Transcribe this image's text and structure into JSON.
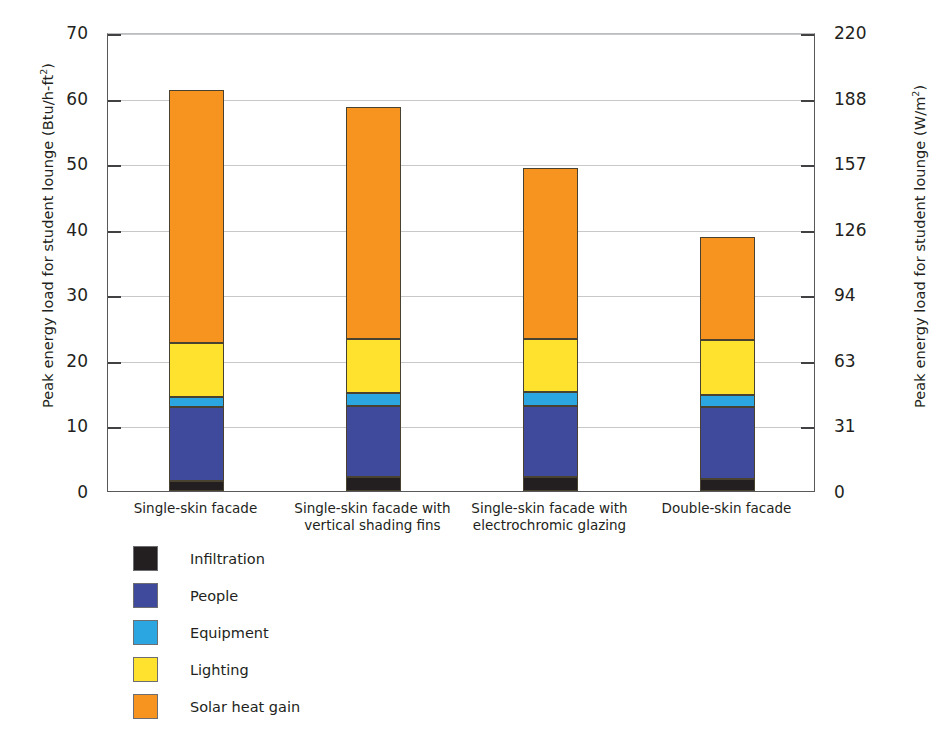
{
  "chart_data": {
    "type": "bar",
    "subtype": "stacked-bar",
    "title": "",
    "xlabel": "",
    "ylabel": "Peak energy load for student lounge (Btu/h-ft²)",
    "ylabel_right": "Peak energy load for student lounge (W/m²)",
    "grid": true,
    "legend_position": "below-left",
    "ylim": [
      0,
      70
    ],
    "ylim_right": [
      0,
      220
    ],
    "yticks": [
      0,
      10,
      20,
      30,
      40,
      50,
      60,
      70
    ],
    "yticklabels": [
      "0",
      "10",
      "20",
      "30",
      "40",
      "50",
      "60",
      "70"
    ],
    "yticks_right": [
      0,
      31,
      63,
      94,
      126,
      157,
      188,
      220
    ],
    "yticklabels_right": [
      "0",
      "31",
      "63",
      "94",
      "126",
      "157",
      "188",
      "220"
    ],
    "categories": [
      "Single-skin facade",
      "Single-skin facade with vertical shading fins",
      "Single-skin facade with electrochromic glazing",
      "Double-skin facade"
    ],
    "category_lines": [
      [
        "Single-skin facade"
      ],
      [
        "Single-skin facade with",
        "vertical shading fins"
      ],
      [
        "Single-skin facade with",
        "electrochromic glazing"
      ],
      [
        "Double-skin facade"
      ]
    ],
    "series": [
      {
        "name": "Infiltration",
        "color": "#231f20",
        "values": [
          1.5,
          2.1,
          2.1,
          1.8
        ]
      },
      {
        "name": "People",
        "color": "#3f4a9c",
        "values": [
          11.3,
          10.9,
          10.9,
          11.0
        ]
      },
      {
        "name": "Equipment",
        "color": "#2ba6e0",
        "values": [
          1.5,
          1.9,
          2.1,
          1.8
        ]
      },
      {
        "name": "Lighting",
        "color": "#ffe22e",
        "values": [
          8.3,
          8.3,
          8.1,
          8.4
        ]
      },
      {
        "name": "Solar heat gain",
        "color": "#f79420",
        "values": [
          38.5,
          35.3,
          26.0,
          15.7
        ]
      }
    ],
    "totals": [
      61.1,
      58.5,
      49.2,
      38.7
    ],
    "units_primary": "Btu/h-ft²",
    "units_secondary": "W/m²"
  },
  "legend": {
    "items": [
      {
        "label": "Infiltration",
        "color": "#231f20"
      },
      {
        "label": "People",
        "color": "#3f4a9c"
      },
      {
        "label": "Equipment",
        "color": "#2ba6e0"
      },
      {
        "label": "Lighting",
        "color": "#ffe22e"
      },
      {
        "label": "Solar heat gain",
        "color": "#f79420"
      }
    ]
  },
  "axis_left": {
    "title_main": "Peak energy load for student lounge (Btu/h-ft",
    "title_sup": "2",
    "title_tail": ")"
  },
  "axis_right": {
    "title_main": "Peak energy load for student lounge (W/m",
    "title_sup": "2",
    "title_tail": ")"
  }
}
